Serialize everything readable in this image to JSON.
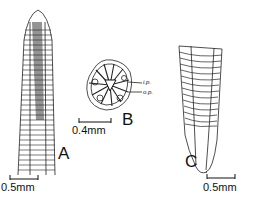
{
  "figure": {
    "panels": [
      {
        "id": "A",
        "label": "A",
        "scale_bar": "0.5 mm",
        "description": "anterior end, lateral view"
      },
      {
        "id": "B",
        "label": "B",
        "scale_bar": "0.4 mm",
        "description": "transverse section",
        "annotations": [
          {
            "text": "i.p."
          },
          {
            "text": "o.p."
          }
        ]
      },
      {
        "id": "C",
        "label": "C",
        "scale_bar": "0.5 mm",
        "description": "posterior end"
      }
    ],
    "scale_text": {
      "a": "0.5mm",
      "b": "0.4mm",
      "c": "0.5mm"
    },
    "labels": {
      "a": "A",
      "b": "B",
      "c": "C",
      "ip": "i.p.",
      "op": "o.p."
    }
  }
}
